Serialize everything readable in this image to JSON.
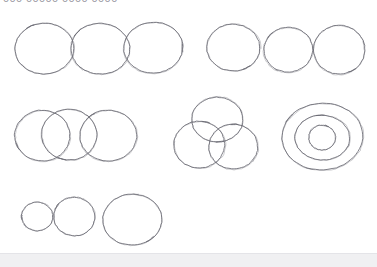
{
  "app": {
    "title": "Hand-drawn Circles Canvas",
    "background_color": "#ffffff",
    "stroke_color": "#6b6b74",
    "status_bar_color": "#f0f0f2"
  },
  "header": {
    "clipped_label": "000 00000 0000 0000",
    "note": "text clipped by top edge of screenshot"
  },
  "status": {
    "text": ""
  },
  "sketch": {
    "type": "freehand-circles",
    "stroke_color": "#6b6b74",
    "stroke_width": 1,
    "groups": [
      {
        "name": "group-top-left-touching-row",
        "label": "three touching circles, equal size, horizontal row",
        "circles": [
          {
            "cx": 44,
            "cy": 48,
            "rx": 29,
            "ry": 25,
            "rotate": -3
          },
          {
            "cx": 100,
            "cy": 48,
            "rx": 29,
            "ry": 25,
            "rotate": 2
          },
          {
            "cx": 153,
            "cy": 47,
            "rx": 29,
            "ry": 25,
            "rotate": -2
          }
        ]
      },
      {
        "name": "group-top-right-separated-row",
        "label": "three separated circles, slightly varying size",
        "circles": [
          {
            "cx": 233,
            "cy": 47,
            "rx": 26,
            "ry": 23,
            "rotate": 3
          },
          {
            "cx": 288,
            "cy": 49,
            "rx": 24,
            "ry": 22,
            "rotate": -4
          },
          {
            "cx": 339,
            "cy": 49,
            "rx": 25,
            "ry": 24,
            "rotate": 2
          }
        ]
      },
      {
        "name": "group-middle-left-overlapping-row",
        "label": "three overlapping circles, horizontal row",
        "circles": [
          {
            "cx": 42,
            "cy": 135,
            "rx": 27,
            "ry": 25,
            "rotate": -2
          },
          {
            "cx": 69,
            "cy": 134,
            "rx": 27,
            "ry": 25,
            "rotate": 3
          },
          {
            "cx": 108,
            "cy": 135,
            "rx": 28,
            "ry": 25,
            "rotate": -1
          }
        ]
      },
      {
        "name": "group-middle-venn-cluster",
        "label": "three overlapping circles in triangular venn arrangement",
        "circles": [
          {
            "cx": 217,
            "cy": 119,
            "rx": 25,
            "ry": 22,
            "rotate": 2
          },
          {
            "cx": 199,
            "cy": 144,
            "rx": 25,
            "ry": 23,
            "rotate": -3
          },
          {
            "cx": 233,
            "cy": 146,
            "rx": 24,
            "ry": 22,
            "rotate": 1
          }
        ]
      },
      {
        "name": "group-concentric-bullseye",
        "label": "three concentric circles forming a bullseye",
        "circles": [
          {
            "cx": 322,
            "cy": 136,
            "rx": 40,
            "ry": 33,
            "rotate": -3
          },
          {
            "cx": 322,
            "cy": 137,
            "rx": 27,
            "ry": 22,
            "rotate": 2
          },
          {
            "cx": 322,
            "cy": 137,
            "rx": 13,
            "ry": 12,
            "rotate": -1
          }
        ]
      },
      {
        "name": "group-bottom-left-increasing-size",
        "label": "three circles increasing in size left to right",
        "circles": [
          {
            "cx": 37,
            "cy": 216,
            "rx": 15,
            "ry": 14,
            "rotate": -2
          },
          {
            "cx": 74,
            "cy": 216,
            "rx": 20,
            "ry": 19,
            "rotate": 3
          },
          {
            "cx": 132,
            "cy": 219,
            "rx": 29,
            "ry": 25,
            "rotate": -2
          }
        ]
      }
    ]
  }
}
